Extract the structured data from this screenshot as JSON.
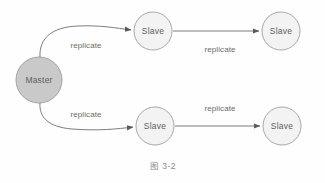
{
  "figure": {
    "caption": "图 3-2",
    "background_color": "#fefefe"
  },
  "colors": {
    "master_fill": "#c9c9c9",
    "master_stroke": "#9a9a9a",
    "slave_fill": "#f3f3f3",
    "slave_stroke": "#9e9e9e",
    "edge_stroke": "#6e6e6e",
    "node_text": "#5e5e5e",
    "edge_text": "#6a6a6a",
    "caption_text": "#8a8a8a"
  },
  "nodes": [
    {
      "id": "master",
      "label": "Master",
      "role": "master",
      "cx": 39,
      "cy": 80,
      "r": 23
    },
    {
      "id": "slave-top-1",
      "label": "Slave",
      "role": "slave",
      "cx": 153,
      "cy": 31,
      "r": 19
    },
    {
      "id": "slave-top-2",
      "label": "Slave",
      "role": "slave",
      "cx": 281,
      "cy": 31,
      "r": 19
    },
    {
      "id": "slave-bottom-1",
      "label": "Slave",
      "role": "slave",
      "cx": 155,
      "cy": 126,
      "r": 19
    },
    {
      "id": "slave-bottom-2",
      "label": "Slave",
      "role": "slave",
      "cx": 282,
      "cy": 126,
      "r": 19
    }
  ],
  "edges": [
    {
      "id": "edge-master-to-slave-top-1",
      "label": "replicate",
      "from": "master",
      "to": "slave-top-1",
      "shape": "curved",
      "path": "M 40,57 C 39,38 52,27 78,26 C 100,25 116,28 131,30",
      "label_x": 86,
      "label_y": 46
    },
    {
      "id": "edge-slave-top-1-to-slave-top-2",
      "label": "replicate",
      "from": "slave-top-1",
      "to": "slave-top-2",
      "shape": "straight",
      "path": "M 173,31 L 259,31",
      "label_x": 220,
      "label_y": 50
    },
    {
      "id": "edge-master-to-slave-bottom-1",
      "label": "replicate",
      "from": "master",
      "to": "slave-bottom-1",
      "shape": "curved",
      "path": "M 40,103 C 39,117 48,127 72,129 C 97,131 118,129 133,127",
      "label_x": 86,
      "label_y": 115
    },
    {
      "id": "edge-slave-bottom-1-to-slave-bottom-2",
      "label": "replicate",
      "from": "slave-bottom-1",
      "to": "slave-bottom-2",
      "shape": "straight",
      "path": "M 175,126 L 260,126",
      "label_x": 220,
      "label_y": 109
    }
  ]
}
